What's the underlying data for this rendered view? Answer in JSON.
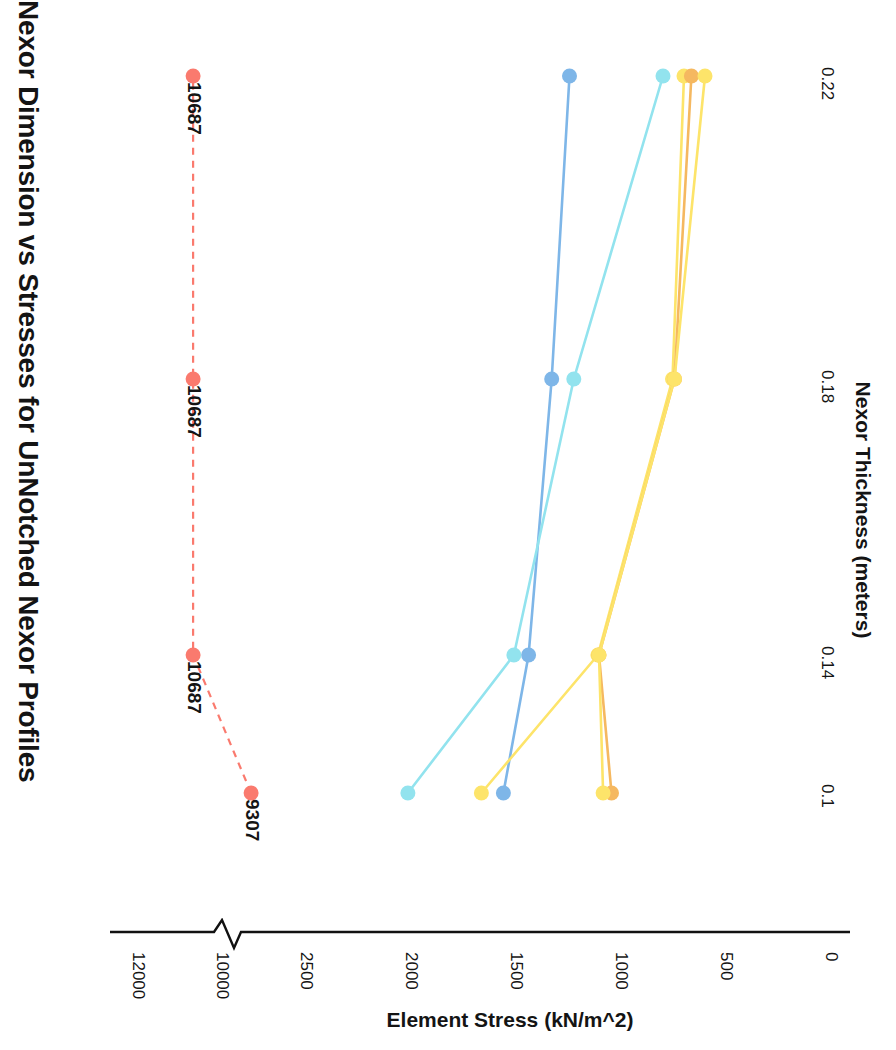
{
  "chart": {
    "title": "Nexor Dimension vs Stresses for UnNotched Nexor Profiles",
    "xlabel": "Nexor Thickness (meters)",
    "ylabel": "Element Stress (kN/m^2)",
    "orientation": "rotated-90"
  },
  "chart_data": {
    "type": "line",
    "title": "Nexor Dimension vs Stresses for UnNotched Nexor Profiles",
    "xlabel": "Nexor Thickness (meters)",
    "ylabel": "Element Stress (kN/m^2)",
    "x": [
      0.1,
      0.14,
      0.18,
      0.22
    ],
    "xtick_labels": [
      "0.1",
      "0.14",
      "0.18",
      "0.22"
    ],
    "ytick_labels": [
      "12000",
      "10000",
      "2500",
      "2000",
      "1500",
      "1000",
      "500",
      "0"
    ],
    "ytick_values": [
      12000,
      10000,
      2500,
      2000,
      1500,
      1000,
      500,
      0
    ],
    "axis_break": {
      "between": [
        10000,
        2500
      ],
      "style": "zigzag"
    },
    "grid": false,
    "legend": "none",
    "series": [
      {
        "name": "series-red",
        "color": "#fa7a6e",
        "linestyle": "dashed",
        "values": [
          9307,
          10687,
          10687,
          10687
        ],
        "data_labels": [
          "9307",
          "10687",
          "10687",
          "10687"
        ]
      },
      {
        "name": "series-blue",
        "color": "#7eb6e8",
        "linestyle": "solid",
        "values": [
          1560,
          1440,
          1330,
          1245
        ]
      },
      {
        "name": "series-cyan",
        "color": "#92e3ee",
        "linestyle": "solid",
        "values": [
          2015,
          1510,
          1225,
          800
        ]
      },
      {
        "name": "series-yellow-a",
        "color": "#fde46a",
        "linestyle": "solid",
        "values": [
          1665,
          1110,
          755,
          700
        ]
      },
      {
        "name": "series-orange",
        "color": "#f5b860",
        "linestyle": "solid",
        "values": [
          1045,
          1105,
          745,
          665
        ]
      },
      {
        "name": "series-yellow-b",
        "color": "#fde46a",
        "linestyle": "solid",
        "values": [
          1085,
          1105,
          745,
          600
        ]
      }
    ]
  },
  "ticks": {
    "stress": [
      {
        "label": "12000",
        "pos": 0
      },
      {
        "label": "10000",
        "pos": 1
      },
      {
        "label": "2500",
        "pos": 2
      },
      {
        "label": "2000",
        "pos": 3
      },
      {
        "label": "1500",
        "pos": 4
      },
      {
        "label": "1000",
        "pos": 5
      },
      {
        "label": "500",
        "pos": 6
      },
      {
        "label": "0",
        "pos": 7
      }
    ],
    "thickness": [
      {
        "label": "0.1"
      },
      {
        "label": "0.14"
      },
      {
        "label": "0.18"
      },
      {
        "label": "0.22"
      }
    ]
  },
  "annotations": [
    {
      "text": "10687"
    },
    {
      "text": "10687"
    },
    {
      "text": "10687"
    },
    {
      "text": "9307"
    }
  ]
}
